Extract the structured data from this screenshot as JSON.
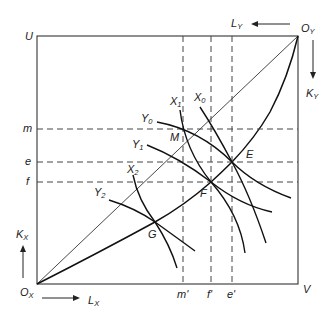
{
  "diagram": {
    "type": "edgeworth-box",
    "corners": {
      "top_left": "U",
      "bottom_right": "V",
      "origin_x": {
        "base": "O",
        "sub": "X"
      },
      "origin_y": {
        "base": "O",
        "sub": "Y"
      }
    },
    "axes": {
      "lx": {
        "base": "L",
        "sub": "X"
      },
      "kx": {
        "base": "K",
        "sub": "X"
      },
      "ly": {
        "base": "L",
        "sub": "Y"
      },
      "ky": {
        "base": "K",
        "sub": "Y"
      }
    },
    "horizontal_guides": [
      "m",
      "e",
      "f"
    ],
    "vertical_guides": [
      "m'",
      "f'",
      "e'"
    ],
    "points": [
      "M",
      "E",
      "F",
      "G"
    ],
    "isoquants_x": [
      {
        "base": "X",
        "sub": "0"
      },
      {
        "base": "X",
        "sub": "1"
      },
      {
        "base": "X",
        "sub": "2"
      }
    ],
    "isoquants_y": [
      {
        "base": "Y",
        "sub": "0"
      },
      {
        "base": "Y",
        "sub": "1"
      },
      {
        "base": "Y",
        "sub": "2"
      }
    ]
  }
}
